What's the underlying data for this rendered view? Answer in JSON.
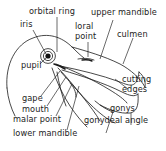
{
  "figure": {
    "type": "labeled anatomical line diagram",
    "background_color": "#ffffff",
    "line_color": "#1a1a1a",
    "text_color": "#1d1d1d"
  },
  "labels": {
    "orbital_ring": "orbital ring",
    "iris": "iris",
    "pupil": "pupil",
    "loral_point_line1": "loral",
    "loral_point_line2": "point",
    "upper_mandible": "upper mandible",
    "culmen": "culmen",
    "cutting_edges_line1": "cutting",
    "cutting_edges_line2": "edges",
    "gonys": "gonys",
    "gonydeal_angle": "gonydeal angle",
    "gape": "gape",
    "mouth": "mouth",
    "malar_point": "malar point",
    "lower_mandible": "lower mandible"
  }
}
